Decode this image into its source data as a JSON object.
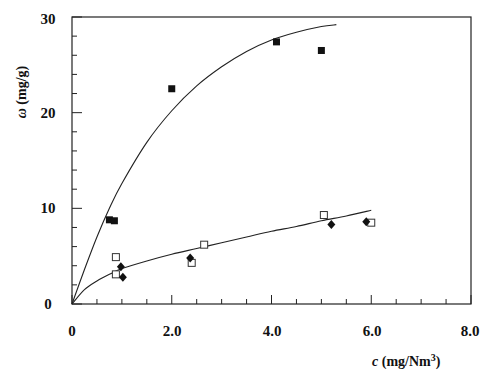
{
  "chart_data": {
    "type": "scatter",
    "title": "",
    "xlabel": "c (mg/Nm3)",
    "ylabel": "ω (mg/g)",
    "xlim": [
      0,
      8.0
    ],
    "ylim": [
      0,
      30
    ],
    "x_ticks": [
      "0",
      "2.0",
      "4.0",
      "6.0",
      "8.0"
    ],
    "y_ticks": [
      "0",
      "10",
      "20",
      "30"
    ],
    "grid": false,
    "legend": null,
    "series": [
      {
        "name": "filled squares",
        "marker": "filled-square",
        "x": [
          0.75,
          0.85,
          2.0,
          4.1,
          5.0
        ],
        "y": [
          8.8,
          8.7,
          22.5,
          27.4,
          26.5
        ]
      },
      {
        "name": "open squares",
        "marker": "open-square",
        "x": [
          0.88,
          0.88,
          2.4,
          2.65,
          5.05,
          6.0
        ],
        "y": [
          4.9,
          3.1,
          4.3,
          6.2,
          9.3,
          8.5
        ]
      },
      {
        "name": "filled diamonds",
        "marker": "filled-diamond",
        "x": [
          0.98,
          1.02,
          2.37,
          5.2,
          5.9
        ],
        "y": [
          3.9,
          2.8,
          4.8,
          8.3,
          8.6
        ]
      }
    ],
    "fitted_curves": [
      {
        "name": "upper fit",
        "x": [
          0,
          0.25,
          0.5,
          0.75,
          1.0,
          1.5,
          2.0,
          2.5,
          3.0,
          3.5,
          4.0,
          4.5,
          5.0,
          5.3
        ],
        "y": [
          0,
          3.6,
          7.0,
          10.0,
          12.6,
          16.9,
          20.2,
          22.8,
          24.8,
          26.4,
          27.6,
          28.4,
          29.0,
          29.2
        ]
      },
      {
        "name": "lower fit",
        "x": [
          0,
          0.25,
          0.5,
          0.75,
          1.0,
          1.5,
          2.0,
          2.5,
          3.0,
          3.5,
          4.0,
          4.5,
          5.0,
          5.5,
          6.0
        ],
        "y": [
          0,
          1.5,
          2.4,
          3.1,
          3.7,
          4.5,
          5.2,
          5.8,
          6.4,
          7.0,
          7.6,
          8.1,
          8.7,
          9.2,
          9.8
        ]
      }
    ]
  },
  "labels": {
    "y_axis_symbol": "ω",
    "y_axis_unit": " (mg/g)",
    "x_axis_symbol": "c",
    "x_axis_unit": " (mg/Nm",
    "x_axis_sup": "3",
    "x_axis_close": ")"
  },
  "ticks": {
    "x": [
      "0",
      "2.0",
      "4.0",
      "6.0",
      "8.0"
    ],
    "y": [
      "0",
      "10",
      "20",
      "30"
    ]
  }
}
